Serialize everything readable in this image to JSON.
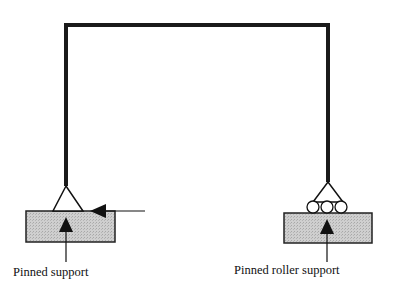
{
  "diagram": {
    "type": "portal frame with supports",
    "labels": {
      "left_support": "Pinned support",
      "right_support": "Pinned roller support"
    },
    "colors": {
      "member": "#1a1a1a",
      "ground_fill": "#c8c8c8",
      "ground_stroke": "#222222"
    }
  }
}
